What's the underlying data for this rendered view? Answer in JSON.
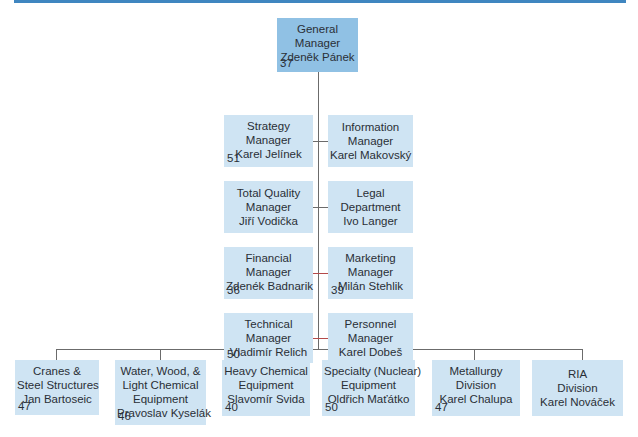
{
  "colors": {
    "top_bar": "#3f86c0",
    "top_box": "#90c1e4",
    "box": "#cfe4f3",
    "connector": "#6b6b6b",
    "text": "#2a2f36"
  },
  "org_chart": {
    "root": {
      "title_lines": [
        "General",
        "Manager"
      ],
      "name": "Zdeněk Pánek",
      "number": "37"
    },
    "staff_left": [
      {
        "title_lines": [
          "Strategy",
          "Manager"
        ],
        "name": "Karel Jelínek",
        "number": "51"
      },
      {
        "title_lines": [
          "Total Quality",
          "Manager"
        ],
        "name": "Jiří Vodička",
        "number": ""
      },
      {
        "title_lines": [
          "Financial",
          "Manager"
        ],
        "name": "Zdenék Badnarik",
        "number": "36"
      },
      {
        "title_lines": [
          "Technical",
          "Manager"
        ],
        "name": "Vladimír Relich",
        "number": "50"
      }
    ],
    "staff_right": [
      {
        "title_lines": [
          "Information",
          "Manager"
        ],
        "name": "Karel Makovský",
        "number": ""
      },
      {
        "title_lines": [
          "Legal",
          "Department"
        ],
        "name": "Ivo Langer",
        "number": ""
      },
      {
        "title_lines": [
          "Marketing",
          "Manager"
        ],
        "name": "Milán Stehlik",
        "number": "39"
      },
      {
        "title_lines": [
          "Personnel",
          "Manager"
        ],
        "name": "Karel Dobeš",
        "number": ""
      }
    ],
    "divisions": [
      {
        "title_lines": [
          "Cranes &",
          "Steel Structures"
        ],
        "name": "Jan Bartoseic",
        "number": "47"
      },
      {
        "title_lines": [
          "Water, Wood, &",
          "Light Chemical",
          "Equipment"
        ],
        "name": "Pravoslav Kyselák",
        "number": "46"
      },
      {
        "title_lines": [
          "Heavy Chemical",
          "Equipment"
        ],
        "name": "Slavomír Svida",
        "number": "40"
      },
      {
        "title_lines": [
          "Specialty (Nuclear)",
          "Equipment"
        ],
        "name": "Oldřich Maťátko",
        "number": "50"
      },
      {
        "title_lines": [
          "Metallurgy",
          "Division"
        ],
        "name": "Karel Chalupa",
        "number": "47"
      },
      {
        "title_lines": [
          "RIA",
          "Division"
        ],
        "name": "Karel Nováček",
        "number": ""
      }
    ]
  }
}
